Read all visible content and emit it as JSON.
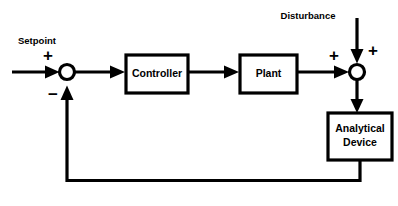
{
  "diagram": {
    "type": "block-diagram",
    "background_color": "#ffffff",
    "line_color": "#000000",
    "canvas": {
      "width": 398,
      "height": 206
    },
    "blocks": [
      {
        "id": "controller",
        "label": "Controller",
        "label_lines": [
          "Controller"
        ],
        "x": 126,
        "y": 55,
        "width": 62,
        "height": 38
      },
      {
        "id": "plant",
        "label": "Plant",
        "label_lines": [
          "Plant"
        ],
        "x": 240,
        "y": 55,
        "width": 57,
        "height": 38
      },
      {
        "id": "analytical_device",
        "label": "Analytical Device",
        "label_lines": [
          "Analytical",
          "Device"
        ],
        "x": 328,
        "y": 113,
        "width": 64,
        "height": 47
      }
    ],
    "junctions": [
      {
        "id": "error_summer",
        "cx": 67,
        "cy": 72,
        "r": 7.5,
        "signs": [
          {
            "text": "+",
            "x": 48,
            "y": 57,
            "for": "setpoint-input"
          },
          {
            "text": "−",
            "x": 53,
            "y": 96,
            "for": "feedback-input"
          }
        ]
      },
      {
        "id": "output_summer",
        "cx": 357,
        "cy": 72,
        "r": 7.5,
        "signs": [
          {
            "text": "+",
            "x": 334,
            "y": 57,
            "for": "plant-output"
          },
          {
            "text": "+",
            "x": 373,
            "y": 52,
            "for": "disturbance-input"
          }
        ]
      }
    ],
    "external_labels": [
      {
        "id": "setpoint",
        "text": "Setpoint",
        "x": 37,
        "y": 41
      },
      {
        "id": "disturbance",
        "text": "Disturbance",
        "x": 308,
        "y": 16
      }
    ],
    "signals": [
      {
        "id": "setpoint-input",
        "from": "external-left",
        "to": "error_summer",
        "label": ""
      },
      {
        "id": "error-signal",
        "from": "error_summer",
        "to": "controller",
        "label": ""
      },
      {
        "id": "control-signal",
        "from": "controller",
        "to": "plant",
        "label": ""
      },
      {
        "id": "plant-output",
        "from": "plant",
        "to": "output_summer",
        "label": ""
      },
      {
        "id": "disturbance-input",
        "from": "external-top",
        "to": "output_summer",
        "label": ""
      },
      {
        "id": "process-output",
        "from": "output_summer",
        "to": "analytical_device",
        "label": ""
      },
      {
        "id": "feedback-signal",
        "from": "analytical_device",
        "to": "error_summer",
        "label": ""
      }
    ]
  }
}
